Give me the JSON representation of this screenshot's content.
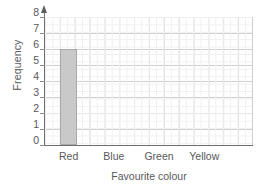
{
  "chart_data": {
    "type": "bar",
    "title": "",
    "subtitle": "",
    "xlabel": "Favourite colour",
    "ylabel": "Frequency",
    "categories": [
      "Red",
      "Blue",
      "Green",
      "Yellow"
    ],
    "values": [
      6,
      0,
      0,
      0
    ],
    "ylim": [
      0,
      8
    ],
    "yticks": [
      0,
      1,
      2,
      3,
      4,
      5,
      6,
      7,
      8
    ],
    "ytick_labels": [
      "0",
      "1",
      "2",
      "3",
      "4",
      "5",
      "6",
      "7",
      "8"
    ],
    "grid": true,
    "grid_minor": true,
    "legend": "none",
    "annotations": [],
    "bar_fill_color": "#c9c9c9",
    "bar_edge_color": "#a9a9ab",
    "grid_major_color": "#cfcfd1",
    "grid_minor_color": "#f0f0f1",
    "axis_color": "#6e6e70",
    "text_color": "#58585a",
    "background_color": "#ffffff",
    "y_axis_has_arrow": true
  },
  "axes": {
    "y_title": "Frequency",
    "x_title": "Favourite colour"
  }
}
